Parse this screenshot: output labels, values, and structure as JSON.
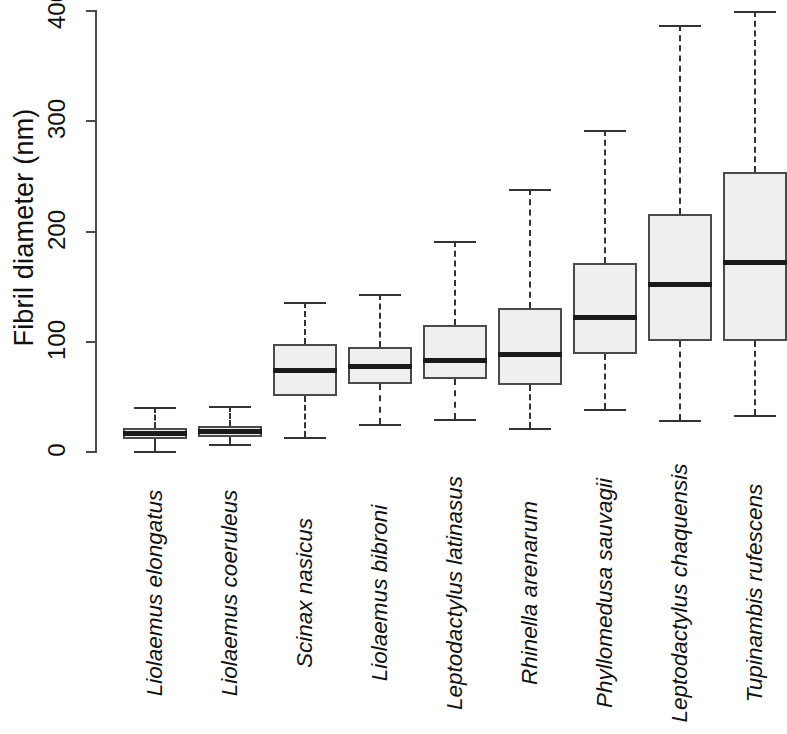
{
  "chart_data": {
    "type": "box",
    "title": "",
    "xlabel": "",
    "ylabel": "Fibril diameter (nm)",
    "ylim": [
      0,
      400
    ],
    "yticks": [
      0,
      100,
      200,
      300,
      400
    ],
    "ytick_labels": [
      "0",
      "100",
      "200",
      "300",
      "400"
    ],
    "grid": false,
    "legend": null,
    "orientation": "vertical",
    "x_label_rotation": 90,
    "x_labels_italic": true,
    "note": "Rightmost box (Tupinambis rufescens) is clipped by the right edge of the image.",
    "categories": [
      "Liolaemus elongatus",
      "Liolaemus coeruleus",
      "Scinax nasicus",
      "Liolaemus bibroni",
      "Leptodactylus latinasus",
      "Rhinella arenarum",
      "Phyllomedusa sauvagii",
      "Leptodactylus chaquensis",
      "Tupinambis rufescens"
    ],
    "boxes": [
      {
        "category": "Liolaemus elongatus",
        "whisker_low": 1,
        "q1": 12,
        "median": 17,
        "q3": 22,
        "whisker_high": 41
      },
      {
        "category": "Liolaemus coeruleus",
        "whisker_low": 7,
        "q1": 14,
        "median": 19,
        "q3": 24,
        "whisker_high": 42
      },
      {
        "category": "Scinax nasicus",
        "whisker_low": 14,
        "q1": 51,
        "median": 74,
        "q3": 98,
        "whisker_high": 136
      },
      {
        "category": "Liolaemus bibroni",
        "whisker_low": 25,
        "q1": 62,
        "median": 78,
        "q3": 95,
        "whisker_high": 143
      },
      {
        "category": "Leptodactylus latinasus",
        "whisker_low": 30,
        "q1": 66,
        "median": 83,
        "q3": 115,
        "whisker_high": 191
      },
      {
        "category": "Rhinella arenarum",
        "whisker_low": 22,
        "q1": 61,
        "median": 88,
        "q3": 131,
        "whisker_high": 239
      },
      {
        "category": "Phyllomedusa sauvagii",
        "whisker_low": 39,
        "q1": 89,
        "median": 122,
        "q3": 171,
        "whisker_high": 292
      },
      {
        "category": "Leptodactylus chaquensis",
        "whisker_low": 29,
        "q1": 101,
        "median": 152,
        "q3": 216,
        "whisker_high": 387
      },
      {
        "category": "Tupinambis rufescens",
        "whisker_low": 34,
        "q1": 101,
        "median": 172,
        "q3": 254,
        "whisker_high": 400
      }
    ]
  },
  "axis": {
    "y_title": "Fibril diameter (nm)"
  }
}
